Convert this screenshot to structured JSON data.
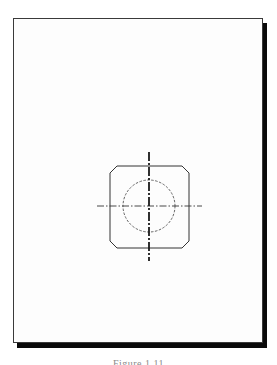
{
  "figure": {
    "caption": "Figure 1.11",
    "colors": {
      "background": "#ffffff",
      "frame_border": "#3a3a3a",
      "frame_shadow": "#0a0a0a",
      "line": "#333333",
      "hidden_line": "#555555",
      "caption": "#8a8a8a"
    },
    "drawing": {
      "outline_shape": "chamfered-square",
      "hidden_feature": "circle (dashed hidden line)",
      "centerlines": [
        "vertical",
        "horizontal"
      ]
    }
  }
}
